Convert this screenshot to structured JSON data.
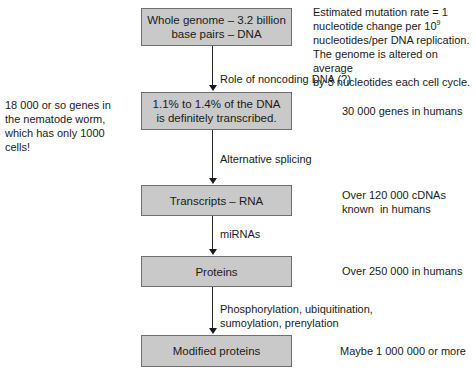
{
  "diagram": {
    "type": "flowchart",
    "nodes": [
      {
        "id": "genome",
        "label": "Whole genome – 3.2 billion base pairs – DNA"
      },
      {
        "id": "transcribed",
        "label": "1.1% to 1.4% of the DNA is definitely transcribed."
      },
      {
        "id": "transcripts",
        "label": "Transcripts – RNA"
      },
      {
        "id": "proteins",
        "label": "Proteins"
      },
      {
        "id": "modified",
        "label": "Modified proteins"
      }
    ],
    "edges": [
      {
        "from": "genome",
        "to": "transcribed",
        "label": "Role of noncoding DNA (?)"
      },
      {
        "from": "transcribed",
        "to": "transcripts",
        "label": "Alternative splicing"
      },
      {
        "from": "transcripts",
        "to": "proteins",
        "label": "miRNAs"
      },
      {
        "from": "proteins",
        "to": "modified",
        "label_line1": "Phosphorylation, ubiquitination,",
        "label_line2": "sumoylation, prenylation"
      }
    ],
    "side_notes": {
      "mutation": {
        "line1": "Estimated mutation rate = 1",
        "line2a": "nucleotide change per 10",
        "line2sup": "9",
        "line3": "nucleotides/per DNA replication.",
        "line4": "The genome is altered on average",
        "line5": "by 3 nucleotides each cell cycle."
      },
      "worm": {
        "line1": "18 000 or so genes in",
        "line2": "the nematode worm,",
        "line3": "which has only 1000",
        "line4": "cells!"
      },
      "genes": "30 000 genes in humans",
      "cdnas_line1": "Over 120 000 cDNAs",
      "cdnas_line2": "known  in humans",
      "proteins_count": "Over 250 000 in humans",
      "modified_count": "Maybe 1 000 000 or more"
    },
    "colors": {
      "box_fill": "#c9c9c9",
      "box_border": "#6f6f6f",
      "arrow": "#1a1a1a"
    }
  }
}
